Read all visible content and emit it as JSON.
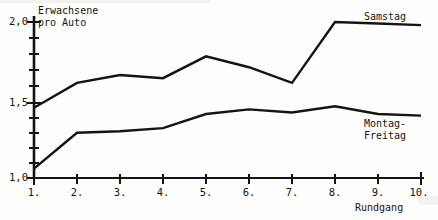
{
  "chart_data": {
    "type": "line",
    "title": "",
    "xlabel": "Rundgang",
    "ylabel": "Erwachsene pro Auto",
    "ylabel_lines": [
      "Erwachsene",
      "pro Auto"
    ],
    "x": [
      1,
      2,
      3,
      4,
      5,
      6,
      7,
      8,
      9,
      10
    ],
    "categories": [
      "1.",
      "2.",
      "3.",
      "4.",
      "5.",
      "6.",
      "7.",
      "8.",
      "9.",
      "10."
    ],
    "xtick_labels": [
      "1.",
      "2.",
      "3.",
      "4.",
      "5.",
      "6.",
      "7.",
      "8.",
      "9.",
      "10."
    ],
    "ytick_labels": [
      "1,0",
      "1,5",
      "2,0"
    ],
    "ytick_values": [
      1.0,
      1.5,
      2.0
    ],
    "yminor_step": 0.1,
    "ylim": [
      1.0,
      2.05
    ],
    "xlim": [
      1,
      10
    ],
    "grid": false,
    "legend_position": "inline-right",
    "series": [
      {
        "name": "Samstag",
        "label": "Samstag",
        "values": [
          1.45,
          1.61,
          1.66,
          1.64,
          1.78,
          1.71,
          1.61,
          2.0,
          1.99,
          1.98
        ]
      },
      {
        "name": "Montag-Freitag",
        "label": "Montag-Freitag",
        "label_lines": [
          "Montag-",
          "Freitag"
        ],
        "values": [
          1.06,
          1.29,
          1.3,
          1.32,
          1.41,
          1.44,
          1.42,
          1.46,
          1.41,
          1.4
        ]
      }
    ],
    "line_color": "#141414",
    "background_color": "#fdfdfb"
  },
  "axes": {
    "x_axis_name": "x-axis",
    "y_axis_name": "y-axis"
  }
}
